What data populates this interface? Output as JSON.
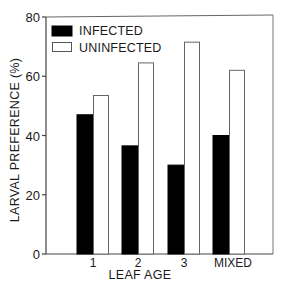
{
  "chart_data": {
    "type": "bar",
    "title": "",
    "xlabel": "LEAF AGE",
    "ylabel": "LARVAL PREFERENCE (%)",
    "categories": [
      "1",
      "2",
      "3",
      "MIXED"
    ],
    "series": [
      {
        "name": "INFECTED",
        "color": "#000000",
        "values": [
          47,
          36.5,
          30,
          40
        ]
      },
      {
        "name": "UNINFECTED",
        "color": "#ffffff",
        "values": [
          53.5,
          64.5,
          71.5,
          62
        ]
      }
    ],
    "ylim": [
      0,
      80
    ],
    "yticks": [
      0,
      20,
      40,
      60,
      80
    ],
    "grid": false,
    "legend_position": "upper-left-inside"
  },
  "axes": {
    "y_tick_labels": [
      "0",
      "20",
      "40",
      "60",
      "80"
    ],
    "x_label": "LEAF AGE",
    "y_label": "LARVAL PREFERENCE (%)"
  },
  "legend": {
    "items": [
      {
        "label": "INFECTED",
        "fill": "#000000"
      },
      {
        "label": "UNINFECTED",
        "fill": "#ffffff"
      }
    ]
  },
  "categories": [
    "1",
    "2",
    "3",
    "MIXED"
  ]
}
